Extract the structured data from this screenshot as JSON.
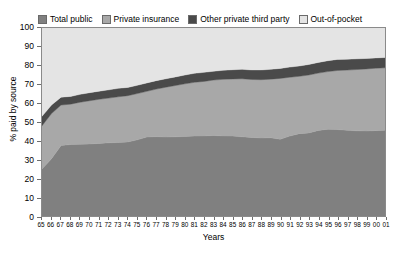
{
  "chart_data": {
    "type": "area",
    "title": "",
    "subtitle": "",
    "xlabel": "Years",
    "ylabel": "% paid by source",
    "stacked": true,
    "grid": false,
    "legend_position": "top",
    "xlim": [
      0,
      36
    ],
    "ylim": [
      0,
      100
    ],
    "yticks": [
      0,
      10,
      20,
      30,
      40,
      50,
      60,
      70,
      80,
      90,
      100
    ],
    "categories": [
      "65",
      "66",
      "67",
      "68",
      "69",
      "70",
      "71",
      "72",
      "73",
      "74",
      "75",
      "76",
      "77",
      "78",
      "79",
      "80",
      "81",
      "82",
      "83",
      "84",
      "85",
      "86",
      "87",
      "88",
      "89",
      "90",
      "91",
      "92",
      "93",
      "94",
      "95",
      "96",
      "97",
      "98",
      "99",
      "00",
      "01"
    ],
    "series": [
      {
        "name": "Total public",
        "color": "#808080",
        "values": [
          25.0,
          30.5,
          37.5,
          38.0,
          38.2,
          38.3,
          38.6,
          38.9,
          39.1,
          39.4,
          40.5,
          42.0,
          42.2,
          42.0,
          42.1,
          42.3,
          42.5,
          42.6,
          42.8,
          42.6,
          42.5,
          42.1,
          41.8,
          41.5,
          41.6,
          40.8,
          42.5,
          43.8,
          44.2,
          45.5,
          46.2,
          46.0,
          45.6,
          45.3,
          45.2,
          45.4,
          45.6
        ]
      },
      {
        "name": "Private insurance",
        "color": "#a8a8a8",
        "values": [
          23.0,
          24.0,
          21.5,
          21.5,
          22.3,
          23.0,
          23.5,
          23.8,
          24.3,
          24.6,
          24.6,
          24.3,
          25.3,
          26.5,
          27.3,
          28.0,
          28.6,
          29.0,
          29.5,
          30.1,
          30.4,
          30.9,
          30.8,
          31.0,
          31.2,
          32.4,
          31.3,
          30.5,
          30.8,
          30.5,
          30.6,
          31.4,
          32.0,
          32.6,
          33.0,
          33.2,
          33.2
        ]
      },
      {
        "name": "Other private third party",
        "color": "#4a4a4a",
        "values": [
          5.0,
          4.5,
          4.2,
          4.1,
          4.2,
          4.3,
          4.3,
          4.4,
          4.5,
          4.4,
          4.4,
          4.5,
          4.5,
          4.5,
          4.6,
          4.7,
          4.8,
          4.8,
          4.7,
          4.8,
          4.9,
          5.0,
          5.1,
          5.2,
          5.2,
          5.3,
          5.4,
          5.5,
          5.6,
          5.7,
          5.8,
          5.9,
          5.8,
          5.7,
          5.6,
          5.5,
          5.5
        ]
      },
      {
        "name": "Out-of-pocket",
        "color": "#e4e4e4",
        "values": [
          47.0,
          41.0,
          36.8,
          36.4,
          35.3,
          34.4,
          33.6,
          32.9,
          32.1,
          31.6,
          30.5,
          29.2,
          28.0,
          27.0,
          26.0,
          25.0,
          24.1,
          23.6,
          23.0,
          22.5,
          22.2,
          22.0,
          22.3,
          22.3,
          22.0,
          21.5,
          20.8,
          20.2,
          19.4,
          18.3,
          17.4,
          16.7,
          16.6,
          16.4,
          16.2,
          15.9,
          15.7
        ]
      }
    ]
  },
  "legend": {
    "items": [
      {
        "label": "Total public",
        "color": "#808080"
      },
      {
        "label": "Private insurance",
        "color": "#a8a8a8"
      },
      {
        "label": "Other private third party",
        "color": "#4a4a4a"
      },
      {
        "label": "Out-of-pocket",
        "color": "#e4e4e4"
      }
    ]
  },
  "axes": {
    "y_title": "% paid by source",
    "x_title": "Years"
  }
}
